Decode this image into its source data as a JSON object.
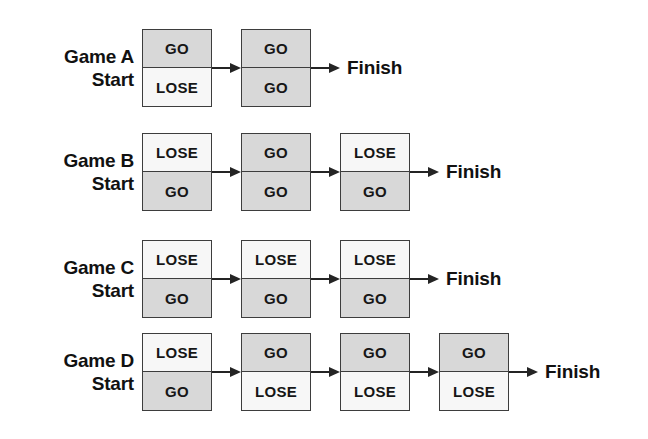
{
  "diagram": {
    "start_suffix": "Start",
    "finish_label": "Finish",
    "colors": {
      "shaded_cell": "#d8d8d8",
      "plain_cell": "#f7f7f7",
      "border": "#3d3d3d",
      "arrow": "#242424",
      "text": "#111111",
      "background": "#ffffff"
    },
    "games": [
      {
        "name": "Game A",
        "start_label": "Start",
        "finish_label": "Finish",
        "boxes": [
          {
            "top": {
              "text": "GO",
              "shaded": true
            },
            "bottom": {
              "text": "LOSE",
              "shaded": false
            }
          },
          {
            "top": {
              "text": "GO",
              "shaded": true
            },
            "bottom": {
              "text": "GO",
              "shaded": true
            }
          }
        ]
      },
      {
        "name": "Game B",
        "start_label": "Start",
        "finish_label": "Finish",
        "boxes": [
          {
            "top": {
              "text": "LOSE",
              "shaded": false
            },
            "bottom": {
              "text": "GO",
              "shaded": true
            }
          },
          {
            "top": {
              "text": "GO",
              "shaded": true
            },
            "bottom": {
              "text": "GO",
              "shaded": true
            }
          },
          {
            "top": {
              "text": "LOSE",
              "shaded": false
            },
            "bottom": {
              "text": "GO",
              "shaded": true
            }
          }
        ]
      },
      {
        "name": "Game C",
        "start_label": "Start",
        "finish_label": "Finish",
        "boxes": [
          {
            "top": {
              "text": "LOSE",
              "shaded": false
            },
            "bottom": {
              "text": "GO",
              "shaded": true
            }
          },
          {
            "top": {
              "text": "LOSE",
              "shaded": false
            },
            "bottom": {
              "text": "GO",
              "shaded": true
            }
          },
          {
            "top": {
              "text": "LOSE",
              "shaded": false
            },
            "bottom": {
              "text": "GO",
              "shaded": true
            }
          }
        ]
      },
      {
        "name": "Game D",
        "start_label": "Start",
        "finish_label": "Finish",
        "boxes": [
          {
            "top": {
              "text": "LOSE",
              "shaded": false
            },
            "bottom": {
              "text": "GO",
              "shaded": true
            }
          },
          {
            "top": {
              "text": "GO",
              "shaded": true
            },
            "bottom": {
              "text": "LOSE",
              "shaded": false
            }
          },
          {
            "top": {
              "text": "GO",
              "shaded": true
            },
            "bottom": {
              "text": "LOSE",
              "shaded": false
            }
          },
          {
            "top": {
              "text": "GO",
              "shaded": true
            },
            "bottom": {
              "text": "LOSE",
              "shaded": false
            }
          }
        ]
      }
    ]
  }
}
